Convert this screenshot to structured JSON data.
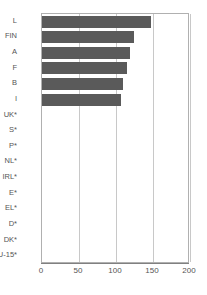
{
  "chart_data": {
    "type": "bar",
    "orientation": "horizontal",
    "title": "",
    "subtitle": "",
    "xlabel": "",
    "ylabel": "",
    "categories": [
      "L",
      "FIN",
      "A",
      "F",
      "B",
      "I",
      "UK*",
      "S*",
      "P*",
      "NL*",
      "IRL*",
      "E*",
      "EL*",
      "D*",
      "DK*",
      "EU-15*"
    ],
    "values": [
      147,
      124,
      119,
      115,
      109,
      107,
      0,
      0,
      0,
      0,
      0,
      0,
      0,
      0,
      0,
      0
    ],
    "xticks": [
      0,
      50,
      100,
      150,
      200
    ],
    "xlim": [
      0,
      200
    ],
    "grid": true,
    "legend": false,
    "series": [
      {
        "name": "",
        "color": "#5a5a5a",
        "values": [
          147,
          124,
          119,
          115,
          109,
          107,
          0,
          0,
          0,
          0,
          0,
          0,
          0,
          0,
          0,
          0
        ]
      }
    ]
  },
  "style": {
    "bar_color": "#5a5a5a",
    "grid_color": "#c8c8c8",
    "axis_color": "#808080",
    "text_color": "#555555",
    "background": "#ffffff"
  }
}
